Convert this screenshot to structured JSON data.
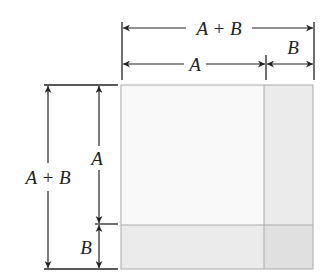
{
  "diagram": {
    "labels": {
      "top_total": "A + B",
      "top_a": "A",
      "top_b": "B",
      "left_total": "A + B",
      "left_a": "A",
      "left_b": "B"
    },
    "regions": [
      {
        "name": "A-squared",
        "color": "#f9f9f9"
      },
      {
        "name": "AB-right-strip",
        "color": "#ebebeb"
      },
      {
        "name": "AB-bottom-strip",
        "color": "#ebebeb"
      },
      {
        "name": "B-squared",
        "color": "#e0e0e0"
      }
    ],
    "border_color": "#aaaaaa",
    "line_color": "#222222"
  }
}
